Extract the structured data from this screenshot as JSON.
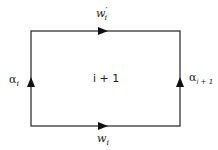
{
  "diagram": {
    "type": "directed-loop",
    "edges": [
      {
        "id": "top",
        "label": "w'_i",
        "direction": "right"
      },
      {
        "id": "bottom",
        "label": "w_i",
        "direction": "right"
      },
      {
        "id": "left",
        "label": "α_i",
        "direction": "up"
      },
      {
        "id": "right",
        "label": "α_{i+1}",
        "direction": "up"
      }
    ],
    "region_label": "i + 1",
    "labels": {
      "top_base": "w",
      "top_prime": "′",
      "top_sub": "i",
      "bottom_base": "w",
      "bottom_sub": "i",
      "left_base": "α",
      "left_sub": "i",
      "right_base": "α",
      "right_sub": "i + 1",
      "center": "i + 1"
    },
    "colors": {
      "stroke": "#222222",
      "background": "#ffffff"
    }
  }
}
